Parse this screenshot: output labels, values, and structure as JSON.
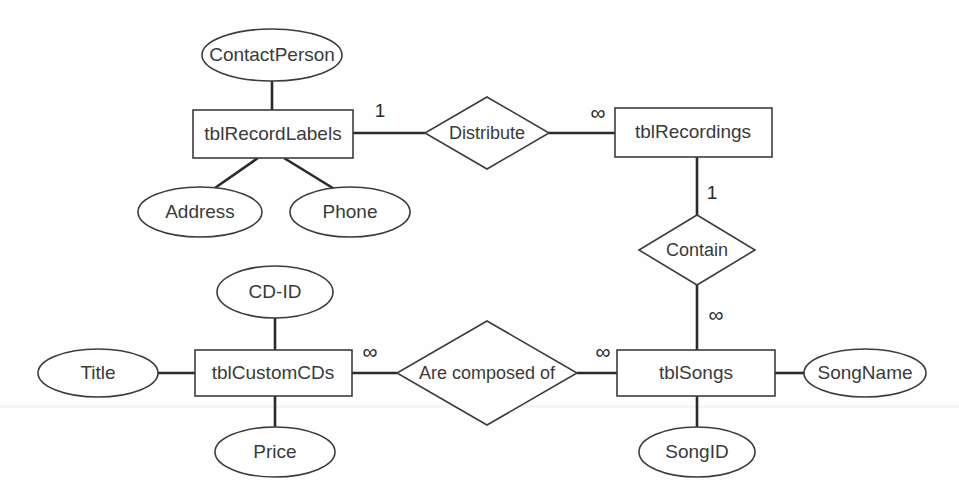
{
  "diagram": {
    "kind": "entity-relationship-diagram",
    "notation": "Chen",
    "canvas": {
      "width": 959,
      "height": 502,
      "background": "#ffffff"
    },
    "colors": {
      "shape_fill": "#ffffff",
      "shape_stroke": "#3c3c3c",
      "connector": "#2a2a2a",
      "text": "#3a3a3a"
    },
    "entities": [
      {
        "id": "tblRecordLabels",
        "label": "tblRecordLabels",
        "x": 193,
        "y": 110,
        "w": 160,
        "h": 48
      },
      {
        "id": "tblRecordings",
        "label": "tblRecordings",
        "x": 615,
        "y": 108,
        "w": 157,
        "h": 49
      },
      {
        "id": "tblCustomCDs",
        "label": "tblCustomCDs",
        "x": 195,
        "y": 350,
        "w": 157,
        "h": 46
      },
      {
        "id": "tblSongs",
        "label": "tblSongs",
        "x": 617,
        "y": 350,
        "w": 158,
        "h": 46
      }
    ],
    "attributes": [
      {
        "id": "ContactPerson",
        "label": "ContactPerson",
        "cx": 272,
        "cy": 55,
        "rx": 70,
        "ry": 26,
        "owner": "tblRecordLabels"
      },
      {
        "id": "Address",
        "label": "Address",
        "cx": 200,
        "cy": 212,
        "rx": 62,
        "ry": 25,
        "owner": "tblRecordLabels"
      },
      {
        "id": "Phone",
        "label": "Phone",
        "cx": 350,
        "cy": 212,
        "rx": 60,
        "ry": 25,
        "owner": "tblRecordLabels"
      },
      {
        "id": "CD-ID",
        "label": "CD-ID",
        "cx": 275,
        "cy": 292,
        "rx": 58,
        "ry": 26,
        "owner": "tblCustomCDs"
      },
      {
        "id": "Title",
        "label": "Title",
        "cx": 98,
        "cy": 372,
        "rx": 60,
        "ry": 24,
        "owner": "tblCustomCDs"
      },
      {
        "id": "Price",
        "label": "Price",
        "cx": 275,
        "cy": 452,
        "rx": 60,
        "ry": 25,
        "owner": "tblCustomCDs"
      },
      {
        "id": "SongName",
        "label": "SongName",
        "cx": 865,
        "cy": 372,
        "rx": 61,
        "ry": 24,
        "owner": "tblSongs"
      },
      {
        "id": "SongID",
        "label": "SongID",
        "cx": 697,
        "cy": 452,
        "rx": 58,
        "ry": 25,
        "owner": "tblSongs"
      }
    ],
    "relationships": [
      {
        "id": "Distribute",
        "label": "Distribute",
        "cx": 487,
        "cy": 133,
        "rx": 62,
        "ry": 36,
        "from": "tblRecordLabels",
        "to": "tblRecordings",
        "from_cardinality": "1",
        "to_cardinality": "∞",
        "orientation": "horizontal"
      },
      {
        "id": "Contain",
        "label": "Contain",
        "cx": 697,
        "cy": 250,
        "rx": 58,
        "ry": 35,
        "from": "tblRecordings",
        "to": "tblSongs",
        "from_cardinality": "1",
        "to_cardinality": "∞",
        "orientation": "vertical"
      },
      {
        "id": "AreComposedOf",
        "label": "Are composed of",
        "cx": 487,
        "cy": 372,
        "rx": 90,
        "ry": 52,
        "from": "tblCustomCDs",
        "to": "tblSongs",
        "from_cardinality": "∞",
        "to_cardinality": "∞",
        "orientation": "horizontal"
      }
    ],
    "cardinality_markers": [
      {
        "id": "distribute-left",
        "text": "1",
        "x": 377,
        "y": 112
      },
      {
        "id": "distribute-right",
        "text": "∞",
        "x": 596,
        "y": 113
      },
      {
        "id": "contain-top",
        "text": "1",
        "x": 710,
        "y": 193
      },
      {
        "id": "contain-bottom",
        "text": "∞",
        "x": 713,
        "y": 315
      },
      {
        "id": "composed-left",
        "text": "∞",
        "x": 368,
        "y": 352
      },
      {
        "id": "composed-right",
        "text": "∞",
        "x": 601,
        "y": 352
      }
    ]
  }
}
